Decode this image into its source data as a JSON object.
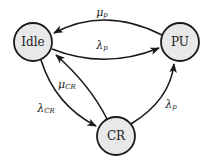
{
  "diagram": {
    "type": "state-transition",
    "nodes": [
      {
        "id": "idle",
        "label": "Idle",
        "cx": 33,
        "cy": 42,
        "r": 19
      },
      {
        "id": "pu",
        "label": "PU",
        "cx": 180,
        "cy": 42,
        "r": 19
      },
      {
        "id": "cr",
        "label": "CR",
        "cx": 116,
        "cy": 136,
        "r": 19
      }
    ],
    "edges": [
      {
        "from": "pu",
        "to": "idle",
        "label_base": "μ",
        "label_sub": "p",
        "label": "μp"
      },
      {
        "from": "idle",
        "to": "pu",
        "label_base": "λ",
        "label_sub": "p",
        "label": "λp"
      },
      {
        "from": "cr",
        "to": "idle",
        "label_base": "μ",
        "label_sub": "CR",
        "label": "μCR"
      },
      {
        "from": "idle",
        "to": "cr",
        "label_base": "λ",
        "label_sub": "CR",
        "label": "λCR"
      },
      {
        "from": "cr",
        "to": "pu",
        "label_base": "λ",
        "label_sub": "p",
        "label": "λp"
      }
    ],
    "colors": {
      "node_fill": "#e8e8e8",
      "stroke": "#1a1a1a",
      "background": "#ffffff"
    }
  }
}
